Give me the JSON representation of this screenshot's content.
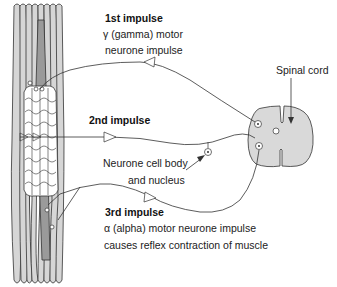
{
  "diagram": {
    "colors": {
      "muscle_fill": "#d6d6d6",
      "spindle_fill": "#9a9a9a",
      "spinal_cord_fill": "#d9d9d9",
      "stroke": "#333333",
      "background": "#ffffff"
    },
    "labels": {
      "first_impulse": {
        "heading": "1st impulse",
        "line1": "γ (gamma) motor",
        "line2": "neurone impulse"
      },
      "spinal_cord": "Spinal cord",
      "second_impulse": {
        "heading": "2nd impulse"
      },
      "neurone_cell_body": {
        "line1": "Neurone cell body",
        "line2": "and nucleus"
      },
      "third_impulse": {
        "heading": "3rd impulse",
        "line1": "α (alpha) motor neurone impulse",
        "line2": "causes reflex contraction of muscle"
      }
    },
    "components": [
      {
        "name": "muscle",
        "type": "fibre-bundle"
      },
      {
        "name": "muscle-spindle",
        "type": "intrafusal-fibres"
      },
      {
        "name": "spinal-cord",
        "type": "cross-section"
      },
      {
        "name": "gamma-motor-neurone",
        "direction": "spinal-cord-to-spindle"
      },
      {
        "name": "sensory-neurone",
        "direction": "spindle-to-spinal-cord"
      },
      {
        "name": "alpha-motor-neurone",
        "direction": "spinal-cord-to-muscle"
      }
    ]
  }
}
